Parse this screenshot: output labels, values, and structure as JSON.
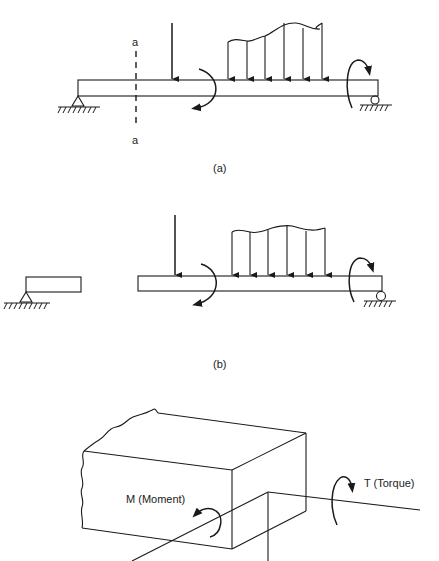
{
  "figure_a": {
    "caption": "(a)",
    "section_label_top": "a",
    "section_label_bottom": "a",
    "elements": [
      "pinned support",
      "point load",
      "applied moment",
      "distributed load (7 arrows... 6 arrows)",
      "end moment",
      "roller support"
    ]
  },
  "figure_b": {
    "caption": "(b)",
    "elements": [
      "cut left segment on pinned support",
      "right segment with point load, moment, distributed load, end moment, roller support"
    ]
  },
  "figure_c": {
    "moment_label": "M (Moment)",
    "torque_label": "T (Torque)"
  }
}
